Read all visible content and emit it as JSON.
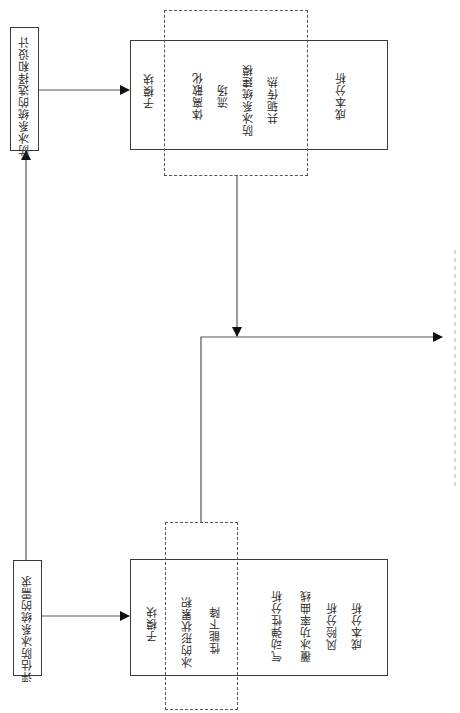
{
  "diagram": {
    "orientation": "rotated-90-ccw",
    "nodes": {
      "selection_design": {
        "label": "防冰系统的选择和设计"
      },
      "requirements": {
        "label": "评估防冰系统的需求"
      },
      "top_module": {
        "header": "子模块",
        "dashed_items": [
          "体离散化",
          "流场",
          "防冰系统建模",
          "共轭传热"
        ],
        "outer_items": [
          "成本分析"
        ]
      },
      "bottom_module": {
        "header": "子模块",
        "dashed_items": [
          "冰的形状累积",
          "性能下降"
        ],
        "outer_items": [
          "气动弹性分析",
          "覆冰功率曲线",
          "风险分析",
          "成本分析"
        ]
      }
    },
    "edges": [
      {
        "from": "requirements",
        "to": "selection_design"
      },
      {
        "from": "selection_design",
        "to": "top_module"
      },
      {
        "from": "requirements",
        "to": "bottom_module"
      },
      {
        "from": "top_module",
        "to": "merge"
      },
      {
        "from": "bottom_module",
        "to": "merge"
      },
      {
        "from": "merge",
        "to": "output"
      }
    ],
    "caption": "",
    "colors": {
      "line": "#3a3a3a",
      "dash": "#555555",
      "caption": "#c8c8c8"
    }
  }
}
